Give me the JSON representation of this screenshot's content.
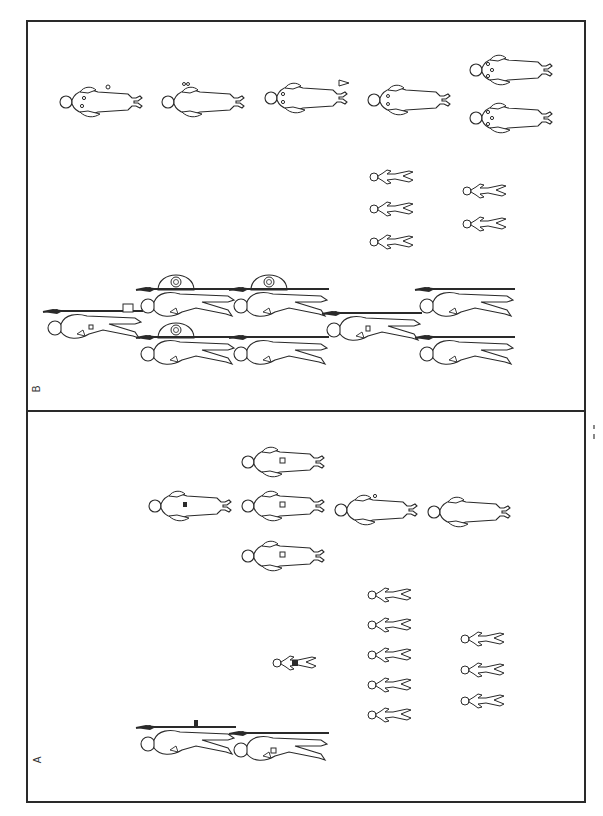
{
  "figure": {
    "panels": [
      {
        "id": "B",
        "label": "B",
        "position": "top"
      },
      {
        "id": "A",
        "label": "A",
        "position": "bottom"
      }
    ],
    "orientation": "rotated 90 degrees (heads to the left)",
    "colors": {
      "line": "#2a2a2a",
      "background": "#ffffff"
    }
  },
  "panel_B": {
    "label": "B",
    "rows": [
      {
        "name": "robed-figures-with-beads",
        "count": 6
      },
      {
        "name": "small-child-figures",
        "count": 5
      },
      {
        "name": "warrior-figures-with-spears",
        "count": 7,
        "with_shield": 3
      }
    ]
  },
  "panel_A": {
    "label": "A",
    "rows": [
      {
        "name": "robed-figures",
        "count": 6
      },
      {
        "name": "small-child-figures",
        "count": 9
      },
      {
        "name": "warrior-figures-with-spears",
        "count": 2
      }
    ]
  }
}
